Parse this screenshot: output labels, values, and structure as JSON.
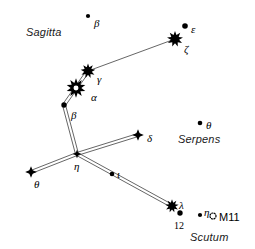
{
  "chart_title": "Aquila constellation star chart",
  "canvas": {
    "width": 255,
    "height": 249,
    "background": "#ffffff"
  },
  "constellation_labels": [
    {
      "name": "sagitta",
      "text": "Sagitta",
      "x": 26,
      "y": 27
    },
    {
      "name": "serpens",
      "text": "Serpens",
      "x": 178,
      "y": 134
    },
    {
      "name": "scutum",
      "text": "Scutum",
      "x": 190,
      "y": 232
    }
  ],
  "stars": [
    {
      "id": "beta-sagitta",
      "label": "β",
      "type": "dot",
      "size": 4.2,
      "x": 88,
      "y": 16,
      "lx": 94,
      "ly": 18
    },
    {
      "id": "epsilon",
      "label": "ε",
      "type": "dot",
      "size": 5.6,
      "x": 185,
      "y": 26,
      "lx": 191,
      "ly": 24
    },
    {
      "id": "zeta",
      "label": "ζ",
      "type": "spiky",
      "size": 12,
      "x": 175,
      "y": 39,
      "lx": 184,
      "ly": 44
    },
    {
      "id": "gamma",
      "label": "γ",
      "type": "spiky",
      "size": 11,
      "x": 88,
      "y": 71,
      "lx": 97,
      "ly": 74
    },
    {
      "id": "alpha",
      "label": "α",
      "type": "altair",
      "size": 15,
      "x": 76,
      "y": 88,
      "lx": 91,
      "ly": 92
    },
    {
      "id": "beta-aquilae",
      "label": "β",
      "type": "dot",
      "size": 5.4,
      "x": 64,
      "y": 105,
      "lx": 71,
      "ly": 110
    },
    {
      "id": "delta",
      "label": "δ",
      "type": "cross",
      "size": 8,
      "x": 138,
      "y": 135,
      "lx": 147,
      "ly": 133
    },
    {
      "id": "theta-serpens",
      "label": "θ",
      "type": "dot",
      "size": 4.6,
      "x": 200,
      "y": 123,
      "lx": 206,
      "ly": 120
    },
    {
      "id": "eta",
      "label": "η",
      "type": "cross",
      "size": 6,
      "x": 77,
      "y": 154,
      "lx": 74,
      "ly": 161
    },
    {
      "id": "theta-aquilae",
      "label": "θ",
      "type": "cross",
      "size": 8,
      "x": 31,
      "y": 172,
      "lx": 34,
      "ly": 179
    },
    {
      "id": "iota",
      "label": "ι",
      "type": "dot",
      "size": 4.6,
      "x": 112,
      "y": 174,
      "lx": 117,
      "ly": 169
    },
    {
      "id": "lambda",
      "label": "λ",
      "type": "spiky",
      "size": 10,
      "x": 172,
      "y": 206,
      "lx": 179,
      "ly": 200
    },
    {
      "id": "twelve-aquilae",
      "label": "12",
      "type": "dot",
      "size": 5.4,
      "x": 180,
      "y": 213,
      "lx": 174,
      "ly": 221
    },
    {
      "id": "eta-scuti",
      "label": "η",
      "type": "dot",
      "size": 4.2,
      "x": 200,
      "y": 215,
      "lx": 204,
      "ly": 207
    }
  ],
  "deep_sky_objects": [
    {
      "id": "m11",
      "label": "M11",
      "symbol": "open-cluster",
      "x": 213,
      "y": 216,
      "lx": 219,
      "ly": 212
    }
  ],
  "lines": [
    {
      "from": "gamma",
      "to": "zeta",
      "style": "single"
    },
    {
      "from": "alpha",
      "to": "gamma",
      "style": "double"
    },
    {
      "from": "alpha",
      "to": "beta-aquilae",
      "style": "double"
    },
    {
      "from": "beta-aquilae",
      "to": "eta",
      "style": "double"
    },
    {
      "from": "eta",
      "to": "delta",
      "style": "double"
    },
    {
      "from": "eta",
      "to": "theta-aquilae",
      "style": "double"
    },
    {
      "from": "eta",
      "to": "lambda",
      "style": "double"
    }
  ],
  "colors": {
    "ink": "#000000",
    "line": "#555555",
    "background": "#ffffff",
    "label": "#1a1a1a"
  }
}
